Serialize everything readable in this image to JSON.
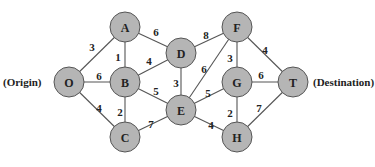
{
  "graph": {
    "labels": {
      "origin": "(Origin)",
      "destination": "(Destination)"
    },
    "nodes": [
      {
        "id": "O",
        "x": 69,
        "y": 82
      },
      {
        "id": "A",
        "x": 125,
        "y": 27
      },
      {
        "id": "B",
        "x": 125,
        "y": 82
      },
      {
        "id": "C",
        "x": 125,
        "y": 137
      },
      {
        "id": "D",
        "x": 181,
        "y": 53
      },
      {
        "id": "E",
        "x": 181,
        "y": 110
      },
      {
        "id": "F",
        "x": 237,
        "y": 27
      },
      {
        "id": "G",
        "x": 237,
        "y": 82
      },
      {
        "id": "H",
        "x": 237,
        "y": 137
      },
      {
        "id": "T",
        "x": 293,
        "y": 82
      }
    ],
    "edges": [
      {
        "from": "O",
        "to": "A",
        "w": "3",
        "lx": 92,
        "ly": 47
      },
      {
        "from": "O",
        "to": "B",
        "w": "6",
        "lx": 99,
        "ly": 76
      },
      {
        "from": "O",
        "to": "C",
        "w": "4",
        "lx": 99,
        "ly": 108
      },
      {
        "from": "A",
        "to": "B",
        "w": "1",
        "lx": 118,
        "ly": 57
      },
      {
        "from": "A",
        "to": "D",
        "w": "6",
        "lx": 156,
        "ly": 32
      },
      {
        "from": "B",
        "to": "D",
        "w": "4",
        "lx": 149,
        "ly": 61
      },
      {
        "from": "B",
        "to": "C",
        "w": "2",
        "lx": 120,
        "ly": 112
      },
      {
        "from": "B",
        "to": "E",
        "w": "5",
        "lx": 156,
        "ly": 91
      },
      {
        "from": "C",
        "to": "E",
        "w": "7",
        "lx": 151,
        "ly": 124
      },
      {
        "from": "D",
        "to": "E",
        "w": "3",
        "lx": 176,
        "ly": 83
      },
      {
        "from": "D",
        "to": "F",
        "w": "8",
        "lx": 206,
        "ly": 35
      },
      {
        "from": "E",
        "to": "F",
        "w": "6",
        "lx": 204,
        "ly": 69
      },
      {
        "from": "E",
        "to": "G",
        "w": "5",
        "lx": 208,
        "ly": 93
      },
      {
        "from": "E",
        "to": "H",
        "w": "4",
        "lx": 211,
        "ly": 125
      },
      {
        "from": "F",
        "to": "G",
        "w": "3",
        "lx": 230,
        "ly": 58
      },
      {
        "from": "F",
        "to": "T",
        "w": "4",
        "lx": 265,
        "ly": 50
      },
      {
        "from": "G",
        "to": "T",
        "w": "6",
        "lx": 261,
        "ly": 75
      },
      {
        "from": "G",
        "to": "H",
        "w": "2",
        "lx": 230,
        "ly": 113
      },
      {
        "from": "H",
        "to": "T",
        "w": "7",
        "lx": 259,
        "ly": 108
      }
    ]
  }
}
